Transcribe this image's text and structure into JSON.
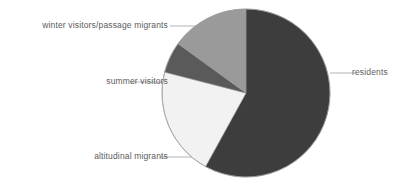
{
  "chart_data": {
    "type": "pie",
    "title": "",
    "categories": [
      "residents",
      "altitudinal migrants",
      "summer visitors",
      "winter visitors/passage migrants"
    ],
    "values": [
      58,
      21,
      6,
      15
    ],
    "units": "percent",
    "legend_position": "callout-labels",
    "grid": false,
    "slice_colors": [
      "#3d3d3d",
      "#f2f2f2",
      "#5a5a5a",
      "#9a9a9a"
    ],
    "start_angle_deg": 0,
    "direction": "clockwise",
    "slices": [
      {
        "label": "residents",
        "value": 58,
        "color": "#3d3d3d",
        "start_deg": 0,
        "end_deg": 208.8
      },
      {
        "label": "altitudinal migrants",
        "value": 21,
        "color": "#f2f2f2",
        "start_deg": 208.8,
        "end_deg": 284.4
      },
      {
        "label": "summer visitors",
        "value": 6,
        "color": "#5a5a5a",
        "start_deg": 284.4,
        "end_deg": 306.0
      },
      {
        "label": "winter visitors/passage migrants",
        "value": 15,
        "color": "#9a9a9a",
        "start_deg": 306.0,
        "end_deg": 360.0
      }
    ]
  },
  "labels": {
    "winter": "winter visitors/passage migrants",
    "summer": "summer visitors",
    "altitudinal": "altitudinal migrants",
    "residents": "residents"
  },
  "style": {
    "background": "#ffffff",
    "text_color": "#5c5c5c",
    "leader_line_color": "#b4b4b4",
    "pie_outline_color": "#9e9e9e"
  }
}
